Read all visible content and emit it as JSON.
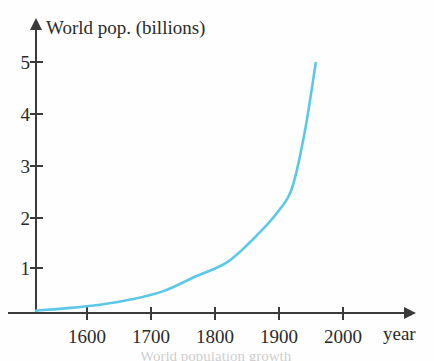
{
  "chart_data": {
    "type": "line",
    "title": "World pop. (billions)",
    "xlabel": "year",
    "ylabel": "World pop. (billions)",
    "xlim": [
      1550,
      2010
    ],
    "ylim": [
      0,
      5.6
    ],
    "grid": false,
    "legend": null,
    "axis_style": "arrow-tipped",
    "line_color": "#5bc8e8",
    "axis_color": "#3a3a3a",
    "x_ticks": [
      1600,
      1700,
      1800,
      1900,
      2000
    ],
    "x_tick_labels": [
      "1600",
      "1700",
      "1800",
      "1900",
      "2000"
    ],
    "y_ticks": [
      1,
      2,
      3,
      4,
      5
    ],
    "y_tick_labels": [
      "1",
      "2",
      "3",
      "4",
      "5"
    ],
    "series": [
      {
        "name": "World population",
        "x": [
          1550,
          1600,
          1650,
          1700,
          1750,
          1800,
          1850,
          1900,
          1930,
          1950,
          1970,
          1987
        ],
        "values": [
          0.05,
          0.1,
          0.17,
          0.28,
          0.45,
          0.75,
          1.05,
          1.65,
          2.1,
          2.55,
          3.7,
          5.1
        ]
      }
    ],
    "annotations": []
  },
  "figure": {
    "x_axis_name": "year",
    "bottom_bleed_text": "World population growth"
  }
}
